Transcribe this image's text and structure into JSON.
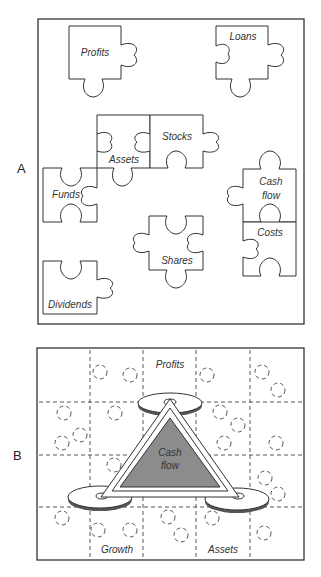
{
  "panel_a": {
    "label": "A",
    "pieces": [
      {
        "label": "Profits",
        "x": 69,
        "y": 26
      },
      {
        "label": "Loans",
        "x": 216,
        "y": 26
      },
      {
        "label": "Assets",
        "x": 97,
        "y": 115
      },
      {
        "label": "Stocks",
        "x": 150,
        "y": 115
      },
      {
        "label": "Funds",
        "x": 43,
        "y": 168
      },
      {
        "label": "Cash",
        "label2": "flow",
        "x": 243,
        "y": 169
      },
      {
        "label": "Costs",
        "x": 243,
        "y": 222
      },
      {
        "label": "Shares",
        "x": 149,
        "y": 216
      },
      {
        "label": "Dividends",
        "x": 43,
        "y": 261
      }
    ]
  },
  "panel_b": {
    "label": "B",
    "center": {
      "line1": "Cash",
      "line2": "flow"
    },
    "corners": {
      "top": "Profits",
      "bottom_left": "Growth",
      "bottom_right": "Assets"
    },
    "colors": {
      "triangle_fill": "#8c8c8c",
      "disc_shadow": "#555555"
    }
  }
}
